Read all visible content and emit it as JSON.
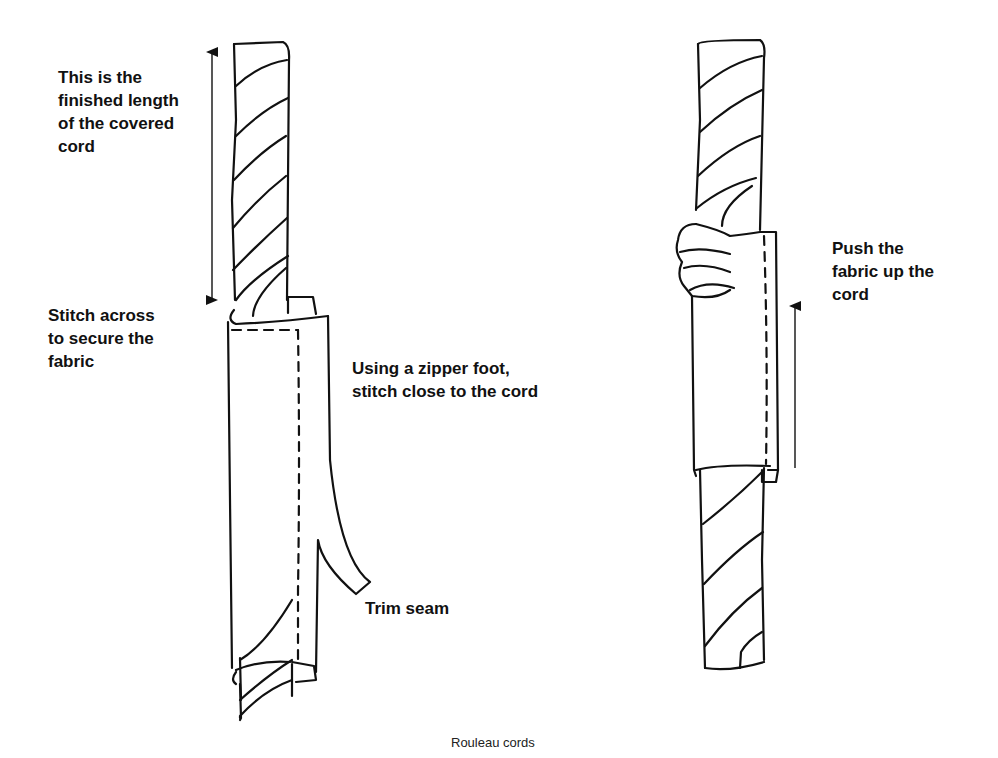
{
  "figure": {
    "caption": "Rouleau cords",
    "left_drawing": {
      "labels": {
        "finished_length": "This is the\nfinished length\nof the covered\ncord",
        "stitch_across": "Stitch across\nto secure the\nfabric",
        "zipper_foot": "Using a zipper foot,\nstitch close to the cord",
        "trim_seam": "Trim seam"
      }
    },
    "right_drawing": {
      "labels": {
        "push_fabric": "Push the\nfabric up the\ncord"
      }
    },
    "colors": {
      "ink": "#111111",
      "background": "#ffffff"
    }
  }
}
